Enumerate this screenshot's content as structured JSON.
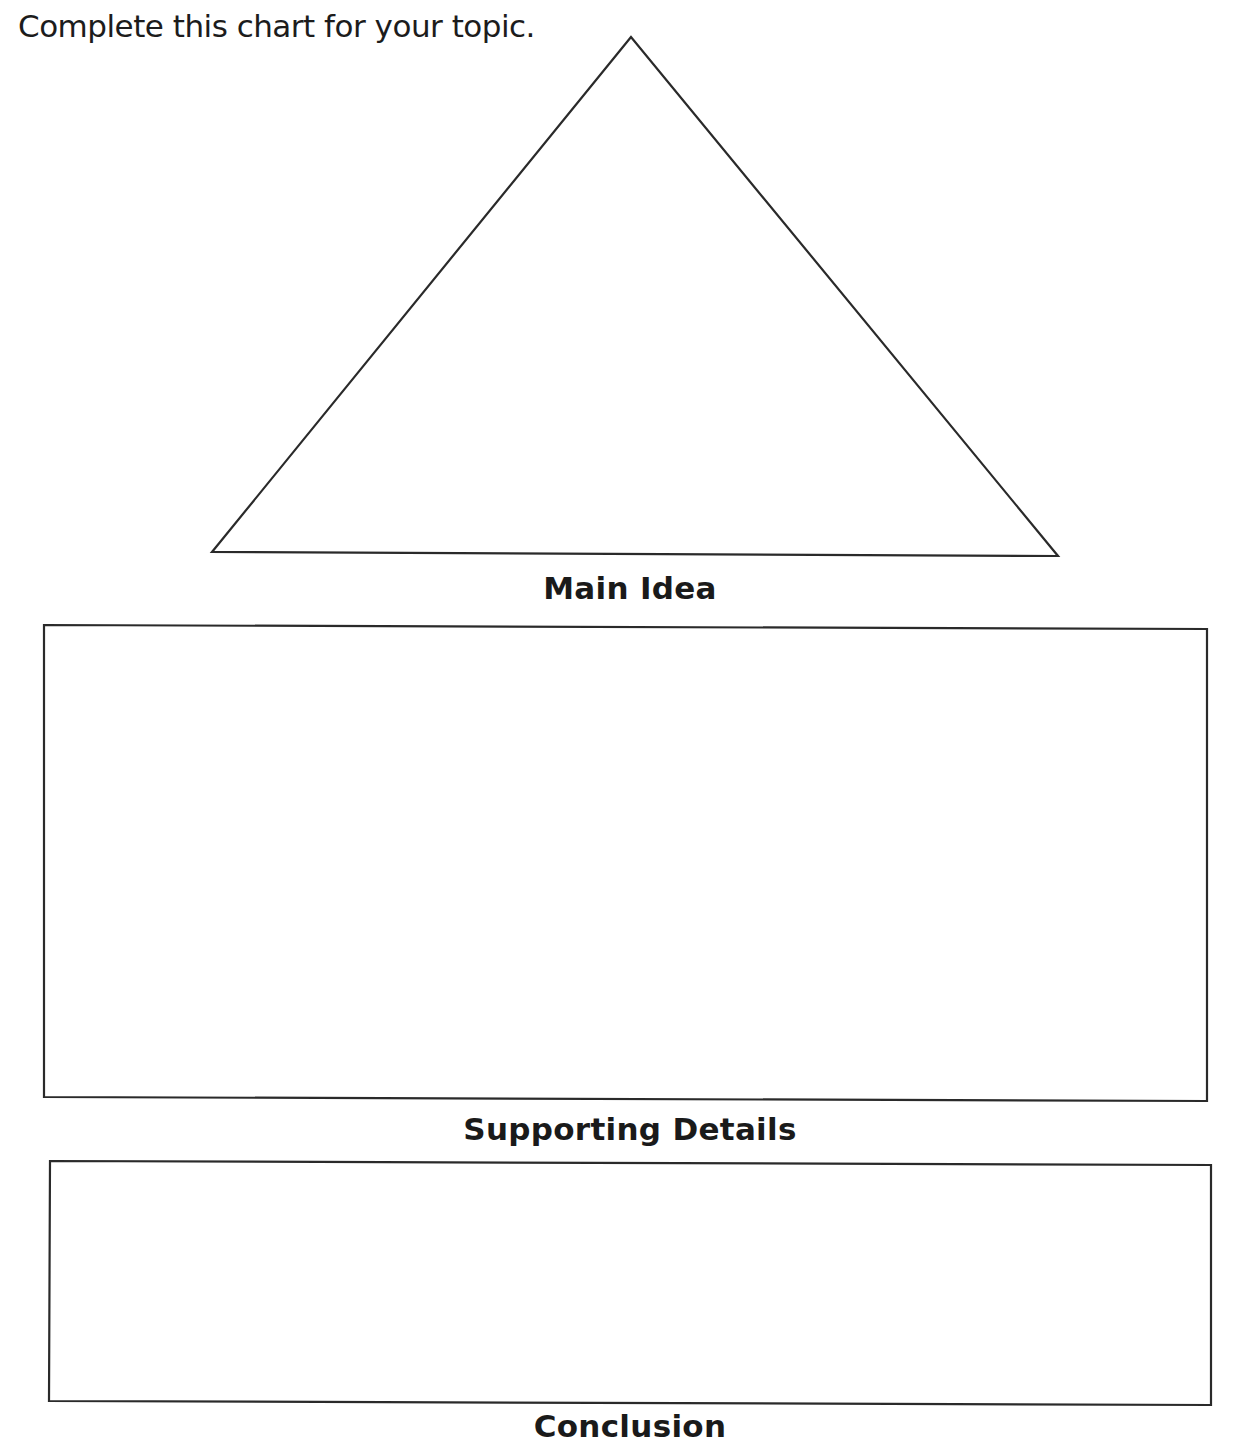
{
  "page": {
    "instruction": "Complete this chart for your topic."
  },
  "organizer": {
    "triangle": {
      "label": "Main Idea"
    },
    "detail_box": {
      "label": "Supporting Details"
    },
    "bottom_box": {
      "label": "Conclusion"
    }
  },
  "colors": {
    "line": "#2a2a2a",
    "background": "#ffffff"
  }
}
